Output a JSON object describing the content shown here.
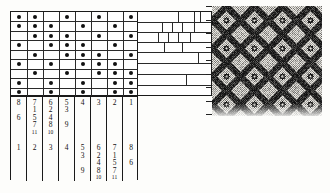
{
  "figure": {
    "kind": "weaving-draft"
  },
  "threading": {
    "label": "threading-grid",
    "cols": 8,
    "rows": 9,
    "cell_w": 16,
    "cell_h": 9.4,
    "dot_color": "#111111",
    "line_color": "#2a2a2a",
    "dots": [
      [
        0,
        1,
        3,
        5,
        7
      ],
      [
        0,
        1,
        2,
        4,
        6
      ],
      [
        1,
        2,
        3,
        5,
        7
      ],
      [
        0,
        2,
        3,
        4,
        6
      ],
      [
        1,
        3,
        4,
        5,
        7
      ],
      [
        0,
        2,
        4,
        5,
        6
      ],
      [
        1,
        3,
        5,
        6,
        7
      ],
      [
        0,
        2,
        4,
        6,
        7
      ],
      [
        0,
        2,
        4,
        6,
        7
      ]
    ]
  },
  "tieup": {
    "label": "tie-up-block-diagram",
    "rows": [
      {
        "y": 0,
        "h": 10,
        "splits": [
          40,
          56,
          62
        ]
      },
      {
        "y": 10,
        "h": 10,
        "splits": [
          24,
          34,
          44,
          56
        ]
      },
      {
        "y": 20,
        "h": 10,
        "splits": [
          20,
          30,
          40,
          52
        ]
      },
      {
        "y": 30,
        "h": 10,
        "splits": [
          26,
          44
        ]
      },
      {
        "y": 40,
        "h": 11,
        "splits": [
          60
        ]
      },
      {
        "y": 51,
        "h": 11,
        "splits": []
      },
      {
        "y": 62,
        "h": 11,
        "splits": [
          48
        ]
      },
      {
        "y": 73,
        "h": 12,
        "splits": []
      }
    ]
  },
  "numbers": {
    "label": "heddle-number-columns",
    "columns": [
      {
        "x": 0,
        "w": 16,
        "entries": [
          {
            "t": "8",
            "x": 50,
            "y": 2,
            "s": "n"
          },
          {
            "t": "6",
            "x": 50,
            "y": 20,
            "s": "n"
          },
          {
            "t": "1",
            "x": 50,
            "y": 56,
            "s": "n"
          }
        ]
      },
      {
        "x": 16,
        "w": 16,
        "entries": [
          {
            "t": "7",
            "x": 50,
            "y": 2,
            "s": "n"
          },
          {
            "t": "1",
            "x": 50,
            "y": 11,
            "s": "n"
          },
          {
            "t": "5",
            "x": 50,
            "y": 20,
            "s": "n"
          },
          {
            "t": "7",
            "x": 50,
            "y": 29,
            "s": "n"
          },
          {
            "t": "11",
            "x": 50,
            "y": 38,
            "s": "s"
          },
          {
            "t": "2",
            "x": 50,
            "y": 56,
            "s": "n"
          }
        ]
      },
      {
        "x": 32,
        "w": 16,
        "entries": [
          {
            "t": "6",
            "x": 50,
            "y": 2,
            "s": "n"
          },
          {
            "t": "2",
            "x": 50,
            "y": 11,
            "s": "n"
          },
          {
            "t": "4",
            "x": 50,
            "y": 20,
            "s": "n"
          },
          {
            "t": "8",
            "x": 50,
            "y": 29,
            "s": "n"
          },
          {
            "t": "10",
            "x": 50,
            "y": 38,
            "s": "s"
          },
          {
            "t": "3",
            "x": 50,
            "y": 56,
            "s": "n"
          }
        ]
      },
      {
        "x": 48,
        "w": 16,
        "entries": [
          {
            "t": "5",
            "x": 50,
            "y": 2,
            "s": "n"
          },
          {
            "t": "3",
            "x": 50,
            "y": 11,
            "s": "n"
          },
          {
            "t": "9",
            "x": 50,
            "y": 29,
            "s": "n"
          },
          {
            "t": "4",
            "x": 50,
            "y": 56,
            "s": "n"
          }
        ]
      },
      {
        "x": 64,
        "w": 16,
        "entries": [
          {
            "t": "4",
            "x": 50,
            "y": 2,
            "s": "n"
          },
          {
            "t": "5",
            "x": 50,
            "y": 56,
            "s": "n"
          },
          {
            "t": "3",
            "x": 50,
            "y": 65,
            "s": "n"
          },
          {
            "t": "9",
            "x": 50,
            "y": 83,
            "s": "n"
          }
        ]
      },
      {
        "x": 80,
        "w": 16,
        "entries": [
          {
            "t": "3",
            "x": 50,
            "y": 2,
            "s": "n"
          },
          {
            "t": "6",
            "x": 50,
            "y": 56,
            "s": "n"
          },
          {
            "t": "2",
            "x": 50,
            "y": 65,
            "s": "n"
          },
          {
            "t": "4",
            "x": 50,
            "y": 74,
            "s": "n"
          },
          {
            "t": "8",
            "x": 50,
            "y": 83,
            "s": "n"
          },
          {
            "t": "10",
            "x": 50,
            "y": 92,
            "s": "s"
          }
        ]
      },
      {
        "x": 96,
        "w": 16,
        "entries": [
          {
            "t": "2",
            "x": 50,
            "y": 2,
            "s": "n"
          },
          {
            "t": "7",
            "x": 50,
            "y": 56,
            "s": "n"
          },
          {
            "t": "1",
            "x": 50,
            "y": 65,
            "s": "n"
          },
          {
            "t": "5",
            "x": 50,
            "y": 74,
            "s": "n"
          },
          {
            "t": "7",
            "x": 50,
            "y": 83,
            "s": "n"
          },
          {
            "t": "11",
            "x": 50,
            "y": 92,
            "s": "s"
          }
        ]
      },
      {
        "x": 112,
        "w": 16,
        "entries": [
          {
            "t": "1",
            "x": 50,
            "y": 2,
            "s": "n"
          },
          {
            "t": "8",
            "x": 50,
            "y": 56,
            "s": "n"
          },
          {
            "t": "6",
            "x": 50,
            "y": 74,
            "s": "n"
          }
        ]
      }
    ]
  },
  "fabric": {
    "label": "woven-fabric-sample",
    "width": 110,
    "height": 110,
    "dark": "#111111",
    "light": "#eceae4",
    "motif": "diamond-lattice",
    "repeat_px": 28,
    "ruler_ticks": 9
  }
}
